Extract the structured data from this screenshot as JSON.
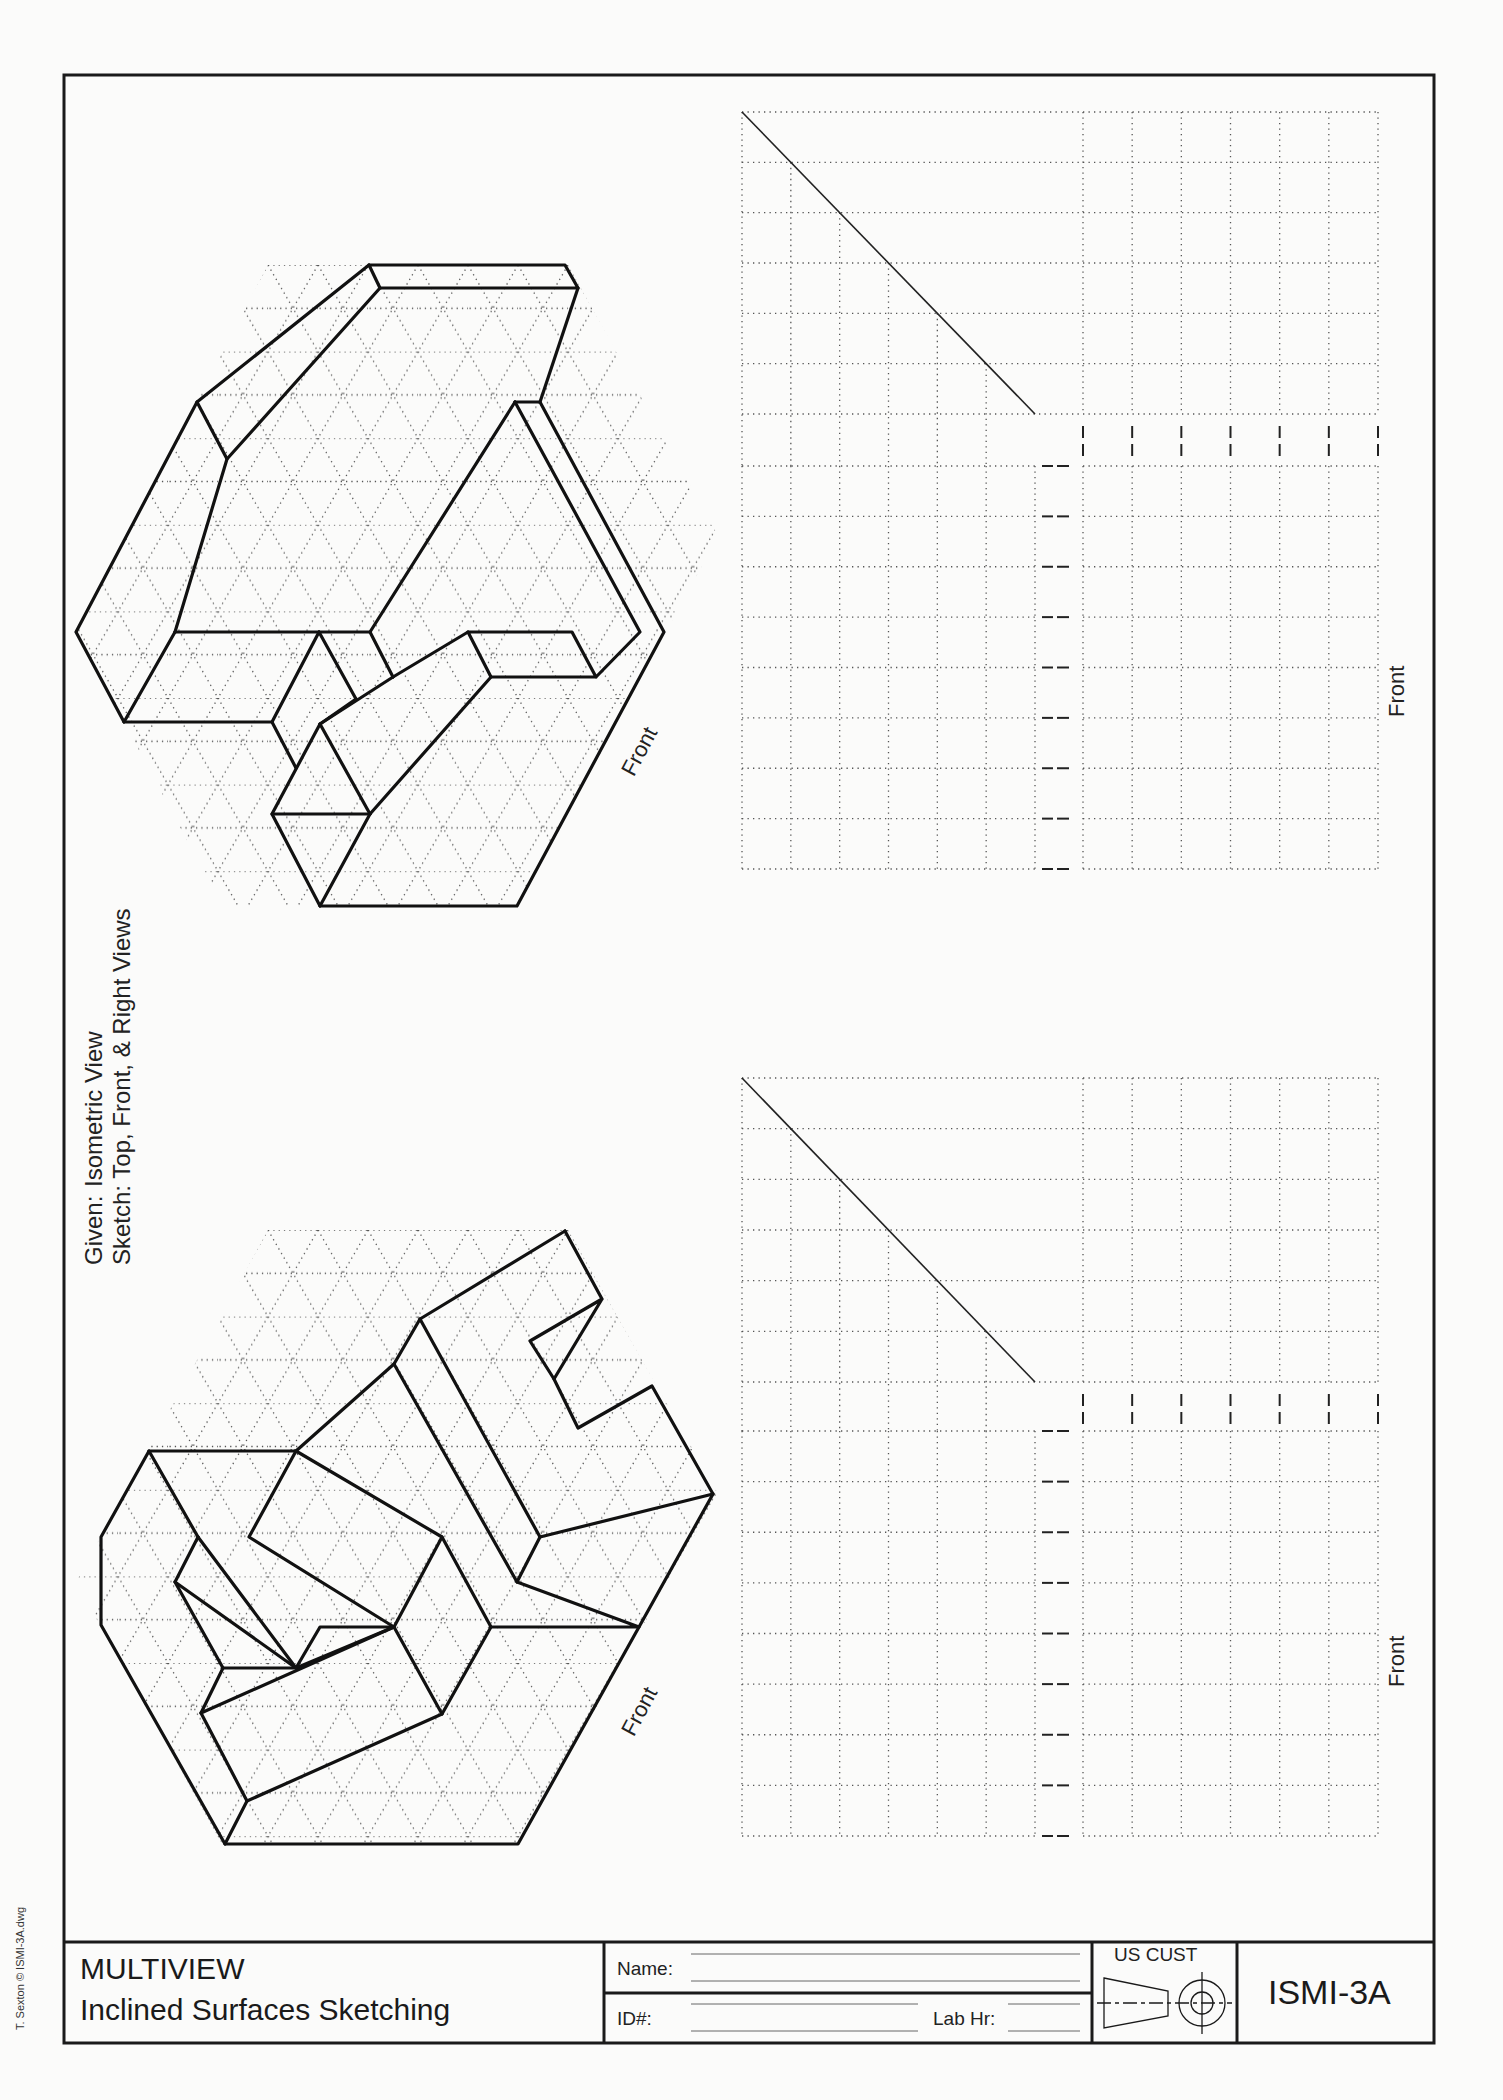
{
  "sheet": {
    "instructions": {
      "given_label": "Given:",
      "given_value": "Isometric View",
      "sketch_label": "Sketch:",
      "sketch_value": "Top, Front, & Right Views"
    },
    "credit": "T. Sexton © ISMI-3A.dwg",
    "problems": [
      {
        "id": 1,
        "iso_front_label": "Front",
        "grid_front_label": "Front",
        "grids": {
          "top": {
            "cols": 6,
            "rows": 6
          },
          "front": {
            "cols": 6,
            "rows": 8
          },
          "right": {
            "cols": 6,
            "rows": 8
          }
        }
      },
      {
        "id": 2,
        "iso_front_label": "Front",
        "grid_front_label": "Front",
        "grids": {
          "top": {
            "cols": 6,
            "rows": 6
          },
          "front": {
            "cols": 6,
            "rows": 8
          },
          "right": {
            "cols": 6,
            "rows": 8
          }
        }
      }
    ],
    "title_block": {
      "title_line1": "MULTIVIEW",
      "title_line2": "Inclined Surfaces Sketching",
      "name_label": "Name:",
      "name_value": "",
      "id_label": "ID#:",
      "id_value": "",
      "lab_hr_label": "Lab Hr:",
      "lab_hr_value": "",
      "projection_standard": "US CUST",
      "projection_icon": "third-angle-projection-icon",
      "drawing_number": "ISMI-3A"
    },
    "colors": {
      "ink": "#1a1a1a",
      "dots": "#555555",
      "paper": "#fbfbfa"
    }
  }
}
